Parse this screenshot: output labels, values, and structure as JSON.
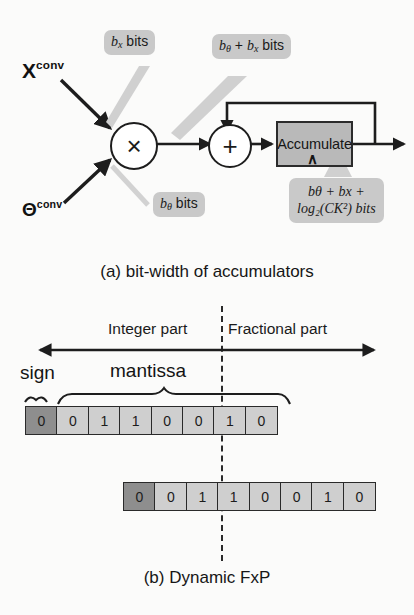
{
  "figure": {
    "background": "#fbfbfa",
    "ink": "#1b1b1b",
    "callout_fill": "#c9c9c9",
    "block_fill": "#b9b9b9",
    "bit_fill": "#cfcfcf",
    "sign_fill": "#8e8e8e"
  },
  "panel_a": {
    "caption": "(a) bit-width of accumulators",
    "inputs": [
      {
        "base": "X",
        "sup": "conv",
        "name": "activation-input"
      },
      {
        "base": "Θ",
        "sup": "conv",
        "name": "weight-input"
      }
    ],
    "operators": {
      "multiply": "×",
      "add": "+"
    },
    "block": {
      "label": "Accumulate",
      "clock_symbol": "∧"
    },
    "callouts": [
      {
        "id": "activation-bits",
        "line1_math": "b",
        "line1_sub": "x",
        "line1_tail": " bits"
      },
      {
        "id": "product-bits",
        "line1_math": "b",
        "line1_sub": "θ",
        "line1_mid": " + ",
        "line1_math2": "b",
        "line1_sub2": "x",
        "line1_tail": " bits"
      },
      {
        "id": "weight-bits",
        "line1_math": "b",
        "line1_sub": "θ",
        "line1_tail": " bits"
      },
      {
        "id": "accumulator-bits",
        "line1": "bθ + bx +",
        "line2": "log₂(CK²) bits"
      }
    ]
  },
  "panel_b": {
    "caption": "(b) Dynamic FxP",
    "axis_labels": {
      "integer": "Integer part",
      "fractional": "Fractional part"
    },
    "brace_labels": {
      "sign": "sign",
      "mantissa": "mantissa"
    },
    "rows": [
      {
        "id": "fxp-row-top",
        "bits": [
          "0",
          "0",
          "1",
          "1",
          "0",
          "0",
          "1",
          "0"
        ],
        "sign_index": 0,
        "radix_after_index": 5
      },
      {
        "id": "fxp-row-bottom",
        "bits": [
          "0",
          "0",
          "1",
          "1",
          "0",
          "0",
          "1",
          "0"
        ],
        "sign_index": 0,
        "radix_after_index": 2
      }
    ]
  }
}
